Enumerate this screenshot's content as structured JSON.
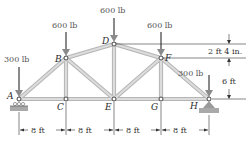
{
  "diagram": {
    "type": "truss",
    "nodes": [
      {
        "id": "A",
        "label": "A"
      },
      {
        "id": "B",
        "label": "B"
      },
      {
        "id": "C",
        "label": "C"
      },
      {
        "id": "D",
        "label": "D"
      },
      {
        "id": "E",
        "label": "E"
      },
      {
        "id": "F",
        "label": "F"
      },
      {
        "id": "G",
        "label": "G"
      },
      {
        "id": "H",
        "label": "H"
      }
    ],
    "loads": [
      {
        "node": "A",
        "label": "300 lb"
      },
      {
        "node": "B",
        "label": "600 lb"
      },
      {
        "node": "D",
        "label": "600 lb"
      },
      {
        "node": "F",
        "label": "600 lb"
      },
      {
        "node": "H",
        "label": "300 lb"
      }
    ],
    "dimensions": {
      "spans": [
        "8 ft",
        "8 ft",
        "8 ft",
        "8 ft"
      ],
      "upper_height": "2 ft 4 in.",
      "lower_height": "6 ft"
    },
    "supports": {
      "A": "roller",
      "H": "pin"
    },
    "colors": {
      "member": "#c9c9c9",
      "member_edge": "#a8a8a8",
      "load_arrow": "#8a8a8a",
      "support": "#9a9a9a"
    }
  }
}
